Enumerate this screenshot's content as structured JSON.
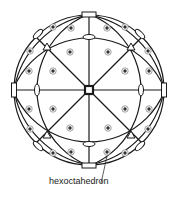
{
  "diagram": {
    "type": "stereographic projection",
    "label": "hexoctahedron",
    "colors": {
      "line": "#1a1a1a",
      "dot": "#444444",
      "background": "#ffffff"
    },
    "primitive_circle": {
      "cx": 89,
      "cy": 90,
      "r": 75
    },
    "poles_upper_left": [
      [
        53,
        27
      ],
      [
        71,
        28
      ],
      [
        30,
        51
      ],
      [
        70,
        52
      ],
      [
        29,
        71
      ],
      [
        53,
        71
      ]
    ]
  }
}
